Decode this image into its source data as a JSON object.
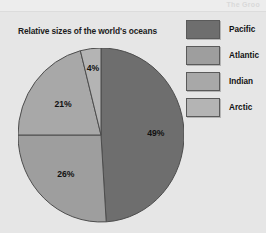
{
  "page": {
    "background_color": "#e6e6e6",
    "top_band_text": "The Groo"
  },
  "chart_title": "Relative sizes of the world's oceans",
  "legend": {
    "items": [
      {
        "label": "Pacific",
        "color": "#6e6e6e"
      },
      {
        "label": "Atlantic",
        "color": "#9e9e9e"
      },
      {
        "label": "Indian",
        "color": "#a8a8a8"
      },
      {
        "label": "Arctic",
        "color": "#b4b4b4"
      }
    ]
  },
  "chart_data": {
    "type": "pie",
    "title": "Relative sizes of the world's oceans",
    "xlabel": "",
    "ylabel": "",
    "legend_position": "right",
    "grid": false,
    "start_angle_deg": 0,
    "direction": "clockwise",
    "categories": [
      "Pacific",
      "Atlantic",
      "Indian",
      "Arctic"
    ],
    "values": [
      49,
      26,
      21,
      4
    ],
    "value_unit": "percent",
    "labels": [
      "49%",
      "26%",
      "21%",
      "4%"
    ],
    "colors": [
      "#6e6e6e",
      "#9e9e9e",
      "#a8a8a8",
      "#b4b4b4"
    ],
    "slices": [
      {
        "name": "Pacific",
        "value": 49,
        "label": "49%",
        "color": "#6e6e6e",
        "start_deg": 0,
        "end_deg": 176.4
      },
      {
        "name": "Atlantic",
        "value": 26,
        "label": "26%",
        "color": "#9e9e9e",
        "start_deg": 176.4,
        "end_deg": 270.0
      },
      {
        "name": "Indian",
        "value": 21,
        "label": "21%",
        "color": "#a8a8a8",
        "start_deg": 270.0,
        "end_deg": 345.6
      },
      {
        "name": "Arctic",
        "value": 4,
        "label": "4%",
        "color": "#b4b4b4",
        "start_deg": 345.6,
        "end_deg": 360.0
      }
    ]
  }
}
